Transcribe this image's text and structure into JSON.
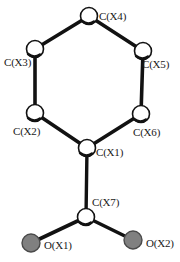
{
  "figure": {
    "type": "molecular-structure-diagram",
    "style": "ball-and-stick ORTEP-like thermal ellipsoid plot",
    "background_color": "#ffffff",
    "bond_color": "#121212",
    "carbon_fill": "#ffffff",
    "carbon_outline": "#121212",
    "oxygen_fill": "#808080",
    "oxygen_outline": "#3a3a3a",
    "atoms": [
      {
        "id": "CX4",
        "label": "C(X4)",
        "element": "C",
        "cx": 89,
        "cy": 16,
        "r": 8.5,
        "fill": "#ffffff",
        "label_x": 99,
        "label_y": 12
      },
      {
        "id": "CX3",
        "label": "C(X3)",
        "element": "C",
        "cx": 35,
        "cy": 49,
        "r": 8.5,
        "fill": "#ffffff",
        "label_x": 4,
        "label_y": 58
      },
      {
        "id": "CX5",
        "label": "C(X5)",
        "element": "C",
        "cx": 143,
        "cy": 51,
        "r": 8.5,
        "fill": "#ffffff",
        "label_x": 142,
        "label_y": 60
      },
      {
        "id": "CX2",
        "label": "C(X2)",
        "element": "C",
        "cx": 35,
        "cy": 113,
        "r": 8.5,
        "fill": "#ffffff",
        "label_x": 13,
        "label_y": 127
      },
      {
        "id": "CX6",
        "label": "C(X6)",
        "element": "C",
        "cx": 141,
        "cy": 114,
        "r": 8.5,
        "fill": "#ffffff",
        "label_x": 133,
        "label_y": 128
      },
      {
        "id": "CX1",
        "label": "C(X1)",
        "element": "C",
        "cx": 87,
        "cy": 148,
        "r": 8.5,
        "fill": "#ffffff",
        "label_x": 96,
        "label_y": 148
      },
      {
        "id": "CX7",
        "label": "C(X7)",
        "element": "C",
        "cx": 86,
        "cy": 217,
        "r": 8.5,
        "fill": "#ffffff",
        "label_x": 92,
        "label_y": 198
      },
      {
        "id": "OX1",
        "label": "O(X1)",
        "element": "O",
        "cx": 31,
        "cy": 243,
        "r": 9.0,
        "fill": "#808080",
        "label_x": 44,
        "label_y": 241
      },
      {
        "id": "OX2",
        "label": "O(X2)",
        "element": "O",
        "cx": 133,
        "cy": 240,
        "r": 9.0,
        "fill": "#808080",
        "label_x": 146,
        "label_y": 239
      }
    ],
    "bonds": [
      {
        "from": "CX4",
        "to": "CX3",
        "order": "ring"
      },
      {
        "from": "CX4",
        "to": "CX5",
        "order": "ring"
      },
      {
        "from": "CX3",
        "to": "CX2",
        "order": "ring"
      },
      {
        "from": "CX5",
        "to": "CX6",
        "order": "ring"
      },
      {
        "from": "CX2",
        "to": "CX1",
        "order": "ring"
      },
      {
        "from": "CX6",
        "to": "CX1",
        "order": "ring"
      },
      {
        "from": "CX1",
        "to": "CX7",
        "order": "single"
      },
      {
        "from": "CX7",
        "to": "OX1",
        "order": "single"
      },
      {
        "from": "CX7",
        "to": "OX2",
        "order": "single"
      }
    ]
  }
}
